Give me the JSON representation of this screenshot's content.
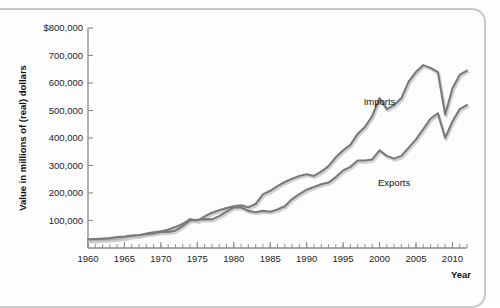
{
  "chart_data": {
    "type": "line",
    "title": "",
    "xlabel": "Year",
    "ylabel": "Value in millions of (real) dollars",
    "xlim": [
      1960,
      2012
    ],
    "ylim": [
      0,
      800000
    ],
    "grid": false,
    "legend_position": "inline-annotation",
    "y_ticks": [
      {
        "value": 100000,
        "label": "100,000"
      },
      {
        "value": 200000,
        "label": "200,000"
      },
      {
        "value": 300000,
        "label": "300,000"
      },
      {
        "value": 400000,
        "label": "400,000"
      },
      {
        "value": 500000,
        "label": "500,000"
      },
      {
        "value": 600000,
        "label": "600,000"
      },
      {
        "value": 700000,
        "label": "700,000"
      },
      {
        "value": 800000,
        "label": "$800,000"
      }
    ],
    "x_ticks": [
      {
        "value": 1960,
        "label": "1960"
      },
      {
        "value": 1965,
        "label": "1965"
      },
      {
        "value": 1970,
        "label": "1970"
      },
      {
        "value": 1975,
        "label": "1975"
      },
      {
        "value": 1980,
        "label": "1980"
      },
      {
        "value": 1985,
        "label": "1985"
      },
      {
        "value": 1990,
        "label": "1990"
      },
      {
        "value": 1995,
        "label": "1995"
      },
      {
        "value": 2000,
        "label": "2000"
      },
      {
        "value": 2005,
        "label": "2005"
      },
      {
        "value": 2010,
        "label": "2010"
      }
    ],
    "x_minor_tick_step": 1,
    "series": [
      {
        "name": "Imports",
        "color": "#7a7a7a",
        "label_x": 2000,
        "label_y": 520000,
        "x": [
          1960,
          1961,
          1962,
          1963,
          1964,
          1965,
          1966,
          1967,
          1968,
          1969,
          1970,
          1971,
          1972,
          1973,
          1974,
          1975,
          1976,
          1977,
          1978,
          1979,
          1980,
          1981,
          1982,
          1983,
          1984,
          1985,
          1986,
          1987,
          1988,
          1989,
          1990,
          1991,
          1992,
          1993,
          1994,
          1995,
          1996,
          1997,
          1998,
          1999,
          2000,
          2001,
          2002,
          2003,
          2004,
          2005,
          2006,
          2007,
          2008,
          2009,
          2010,
          2011,
          2012
        ],
        "values": [
          28000,
          28000,
          30000,
          31000,
          33000,
          37000,
          43000,
          45000,
          53000,
          57000,
          61000,
          66000,
          76000,
          88000,
          105000,
          98000,
          115000,
          128000,
          137000,
          145000,
          152000,
          155000,
          148000,
          160000,
          195000,
          208000,
          225000,
          240000,
          252000,
          262000,
          268000,
          262000,
          278000,
          298000,
          330000,
          355000,
          375000,
          415000,
          440000,
          480000,
          545000,
          505000,
          520000,
          545000,
          605000,
          640000,
          665000,
          655000,
          640000,
          485000,
          580000,
          630000,
          645000
        ]
      },
      {
        "name": "Exports",
        "color": "#7a7a7a",
        "label_x": 2002,
        "label_y": 225000,
        "x": [
          1960,
          1961,
          1962,
          1963,
          1964,
          1965,
          1966,
          1967,
          1968,
          1969,
          1970,
          1971,
          1972,
          1973,
          1974,
          1975,
          1976,
          1977,
          1978,
          1979,
          1980,
          1981,
          1982,
          1983,
          1984,
          1985,
          1986,
          1987,
          1988,
          1989,
          1990,
          1991,
          1992,
          1993,
          1994,
          1995,
          1996,
          1997,
          1998,
          1999,
          2000,
          2001,
          2002,
          2003,
          2004,
          2005,
          2006,
          2007,
          2008,
          2009,
          2010,
          2011,
          2012
        ],
        "values": [
          32000,
          33000,
          34000,
          36000,
          40000,
          42000,
          45000,
          47000,
          50000,
          53000,
          58000,
          58000,
          63000,
          80000,
          100000,
          103000,
          105000,
          104000,
          116000,
          132000,
          148000,
          147000,
          135000,
          130000,
          135000,
          132000,
          140000,
          152000,
          178000,
          196000,
          212000,
          222000,
          232000,
          238000,
          258000,
          282000,
          295000,
          318000,
          318000,
          322000,
          355000,
          335000,
          325000,
          335000,
          365000,
          395000,
          432000,
          470000,
          490000,
          400000,
          460000,
          505000,
          520000
        ]
      }
    ]
  },
  "axis": {
    "y_title": "Value in millions of (real) dollars",
    "x_title": "Year"
  }
}
